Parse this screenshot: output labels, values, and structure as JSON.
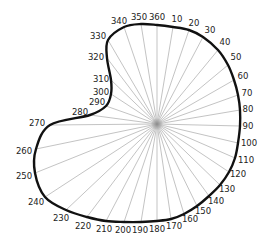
{
  "diagram": {
    "type": "polar-outline",
    "center": [
      157,
      124
    ],
    "colors": {
      "outline": "#111111",
      "spokes": "#9a9a9a",
      "labels": "#222222",
      "background": "#ffffff"
    },
    "points": [
      {
        "angle": "360",
        "x": 157,
        "y": 25,
        "lx": 157,
        "ly": 17
      },
      {
        "angle": "10",
        "x": 173,
        "y": 27,
        "lx": 177,
        "ly": 19
      },
      {
        "angle": "20",
        "x": 189,
        "y": 30,
        "lx": 194,
        "ly": 23
      },
      {
        "angle": "30",
        "x": 203,
        "y": 37,
        "lx": 210,
        "ly": 30
      },
      {
        "angle": "40",
        "x": 218,
        "y": 50,
        "lx": 225,
        "ly": 42
      },
      {
        "angle": "50",
        "x": 228,
        "y": 65,
        "lx": 236,
        "ly": 57
      },
      {
        "angle": "60",
        "x": 234,
        "y": 80,
        "lx": 243,
        "ly": 76
      },
      {
        "angle": "70",
        "x": 238,
        "y": 95,
        "lx": 247,
        "ly": 93
      },
      {
        "angle": "80",
        "x": 240,
        "y": 110,
        "lx": 248,
        "ly": 109
      },
      {
        "angle": "90",
        "x": 240,
        "y": 126,
        "lx": 248,
        "ly": 126
      },
      {
        "angle": "100",
        "x": 238,
        "y": 143,
        "lx": 249,
        "ly": 143
      },
      {
        "angle": "110",
        "x": 235,
        "y": 158,
        "lx": 246,
        "ly": 160
      },
      {
        "angle": "120",
        "x": 229,
        "y": 172,
        "lx": 238,
        "ly": 174
      },
      {
        "angle": "130",
        "x": 220,
        "y": 185,
        "lx": 227,
        "ly": 189
      },
      {
        "angle": "140",
        "x": 209,
        "y": 196,
        "lx": 216,
        "ly": 201
      },
      {
        "angle": "150",
        "x": 197,
        "y": 206,
        "lx": 203,
        "ly": 211
      },
      {
        "angle": "160",
        "x": 184,
        "y": 214,
        "lx": 190,
        "ly": 219
      },
      {
        "angle": "170",
        "x": 171,
        "y": 219,
        "lx": 174,
        "ly": 226
      },
      {
        "angle": "180",
        "x": 157,
        "y": 221,
        "lx": 157,
        "ly": 229
      },
      {
        "angle": "190",
        "x": 141,
        "y": 222,
        "lx": 140,
        "ly": 230
      },
      {
        "angle": "200",
        "x": 124,
        "y": 222,
        "lx": 123,
        "ly": 230
      },
      {
        "angle": "210",
        "x": 106,
        "y": 221,
        "lx": 104,
        "ly": 229
      },
      {
        "angle": "220",
        "x": 87,
        "y": 217,
        "lx": 83,
        "ly": 226
      },
      {
        "angle": "230",
        "x": 66,
        "y": 210,
        "lx": 61,
        "ly": 218
      },
      {
        "angle": "240",
        "x": 45,
        "y": 197,
        "lx": 36,
        "ly": 202
      },
      {
        "angle": "250",
        "x": 35,
        "y": 173,
        "lx": 24,
        "ly": 176
      },
      {
        "angle": "260",
        "x": 36,
        "y": 149,
        "lx": 24,
        "ly": 151
      },
      {
        "angle": "270",
        "x": 50,
        "y": 125,
        "lx": 37,
        "ly": 123
      },
      {
        "angle": "280",
        "x": 90,
        "y": 115,
        "lx": 80,
        "ly": 112
      },
      {
        "angle": "290",
        "x": 106,
        "y": 106,
        "lx": 97,
        "ly": 102
      },
      {
        "angle": "300",
        "x": 111,
        "y": 94,
        "lx": 101,
        "ly": 92
      },
      {
        "angle": "310",
        "x": 111,
        "y": 80,
        "lx": 101,
        "ly": 79
      },
      {
        "angle": "320",
        "x": 107,
        "y": 58,
        "lx": 96,
        "ly": 57
      },
      {
        "angle": "330",
        "x": 108,
        "y": 40,
        "lx": 98,
        "ly": 36
      },
      {
        "angle": "340",
        "x": 124,
        "y": 27,
        "lx": 119,
        "ly": 21
      },
      {
        "angle": "350",
        "x": 141,
        "y": 24,
        "lx": 139,
        "ly": 17
      }
    ]
  }
}
